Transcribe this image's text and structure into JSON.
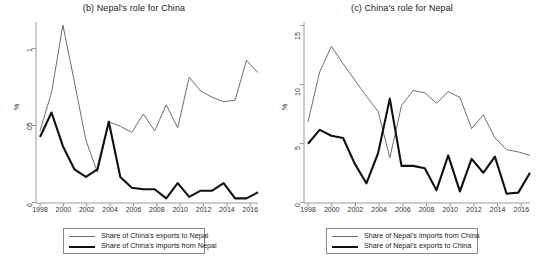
{
  "figure": {
    "background": "#ffffff",
    "panels": [
      {
        "id": "panel-b",
        "title": "(b) Nepal's role for China",
        "ylabel": "%",
        "yticks": [
          "0",
          ".05",
          "1"
        ],
        "xticks": [
          "1998",
          "2000",
          "2002",
          "2004",
          "2006",
          "2008",
          "2010",
          "2012",
          "2014",
          "2016"
        ],
        "legend": [
          {
            "label": "Share of China's exports to Nepal",
            "style": "thin",
            "color": "#6e6e6e"
          },
          {
            "label": "Share of China's imports from Nepal",
            "style": "thick",
            "color": "#101010"
          }
        ]
      },
      {
        "id": "panel-c",
        "title": "(c) China's role for Nepal",
        "ylabel": "%",
        "yticks": [
          "0",
          "5",
          "10",
          "15"
        ],
        "xticks": [
          "1998",
          "2000",
          "2002",
          "2004",
          "2006",
          "2008",
          "2010",
          "2012",
          "2014",
          "2016"
        ],
        "legend": [
          {
            "label": "Share of Nepal's imports from China",
            "style": "thin",
            "color": "#6e6e6e"
          },
          {
            "label": "Share of Nepal's exports to China",
            "style": "thick",
            "color": "#101010"
          }
        ]
      }
    ]
  },
  "chart_data": [
    {
      "type": "line",
      "id": "panel-b",
      "title": "(b) Nepal's role for China",
      "xlabel": "",
      "ylabel": "%",
      "xlim": [
        1998,
        2017
      ],
      "ylim": [
        0,
        1.18
      ],
      "ytick_values": [
        0,
        0.5,
        1
      ],
      "ytick_labels": [
        "0",
        ".05",
        "1"
      ],
      "xtick_values": [
        1998,
        2000,
        2002,
        2004,
        2006,
        2008,
        2010,
        2012,
        2014,
        2016
      ],
      "grid": false,
      "legend_position": "below",
      "x": [
        1998,
        1999,
        2000,
        2001,
        2002,
        2003,
        2004,
        2005,
        2006,
        2007,
        2008,
        2009,
        2010,
        2011,
        2012,
        2013,
        2014,
        2015,
        2016,
        2017
      ],
      "series": [
        {
          "name": "Share of China's exports to Nepal",
          "style": "thin",
          "color": "#6e6e6e",
          "values": [
            0.47,
            0.72,
            1.16,
            0.79,
            0.41,
            0.2,
            0.53,
            0.5,
            0.46,
            0.58,
            0.47,
            0.64,
            0.49,
            0.82,
            0.73,
            0.69,
            0.66,
            0.67,
            0.93,
            0.85
          ]
        },
        {
          "name": "Share of China's imports from Nepal",
          "style": "thick",
          "color": "#101010",
          "values": [
            0.43,
            0.59,
            0.37,
            0.22,
            0.17,
            0.22,
            0.53,
            0.17,
            0.1,
            0.09,
            0.09,
            0.03,
            0.13,
            0.04,
            0.08,
            0.08,
            0.13,
            0.03,
            0.03,
            0.07
          ]
        }
      ]
    },
    {
      "type": "line",
      "id": "panel-c",
      "title": "(c) China's role for Nepal",
      "xlabel": "",
      "ylabel": "%",
      "xlim": [
        1998,
        2017
      ],
      "ylim": [
        0,
        15.6
      ],
      "ytick_values": [
        0,
        5,
        10,
        15
      ],
      "ytick_labels": [
        "0",
        "5",
        "10",
        "15"
      ],
      "xtick_values": [
        1998,
        2000,
        2002,
        2004,
        2006,
        2008,
        2010,
        2012,
        2014,
        2016
      ],
      "grid": false,
      "legend_position": "below",
      "x": [
        1998,
        1999,
        2000,
        2001,
        2002,
        2003,
        2004,
        2005,
        2006,
        2007,
        2008,
        2009,
        2010,
        2011,
        2012,
        2013,
        2014,
        2015,
        2016,
        2017
      ],
      "series": [
        {
          "name": "Share of Nepal's imports from China",
          "style": "thin",
          "color": "#6e6e6e",
          "values": [
            7.0,
            11.3,
            13.5,
            12.0,
            10.6,
            9.2,
            7.9,
            3.9,
            8.4,
            9.7,
            9.5,
            8.6,
            9.6,
            9.1,
            6.4,
            7.6,
            5.6,
            4.6,
            4.4,
            4.1
          ]
        },
        {
          "name": "Share of Nepal's exports to China",
          "style": "thick",
          "color": "#101010",
          "values": [
            5.1,
            6.3,
            5.8,
            5.6,
            3.4,
            1.7,
            4.3,
            9.0,
            3.2,
            3.2,
            3.0,
            1.1,
            4.1,
            1.0,
            3.8,
            2.6,
            4.0,
            0.8,
            0.9,
            2.6
          ]
        }
      ]
    }
  ]
}
